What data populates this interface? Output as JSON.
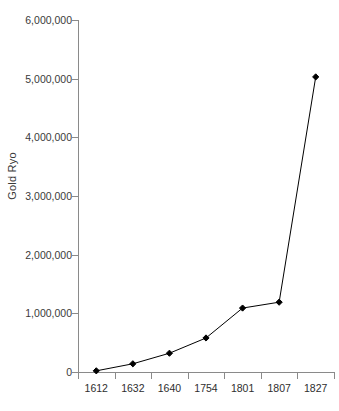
{
  "chart_data": {
    "type": "line",
    "title": "",
    "xlabel": "",
    "ylabel": "Gold Ryo",
    "categories": [
      "1612",
      "1632",
      "1640",
      "1754",
      "1801",
      "1807",
      "1827"
    ],
    "values": [
      20000,
      140000,
      320000,
      580000,
      1090000,
      1190000,
      5030000
    ],
    "series": [
      {
        "name": "Gold Ryo",
        "values": [
          20000,
          140000,
          320000,
          580000,
          1090000,
          1190000,
          5030000
        ]
      }
    ],
    "ylim": [
      0,
      6000000
    ],
    "ytick_values": [
      0,
      1000000,
      2000000,
      3000000,
      4000000,
      5000000,
      6000000
    ],
    "ytick_labels": [
      "0",
      "1,000,000",
      "2,000,000",
      "3,000,000",
      "4,000,000",
      "5,000,000",
      "6,000,000"
    ],
    "grid": false,
    "legend": "none",
    "marker": "diamond",
    "line_color": "#000000",
    "marker_color": "#000000",
    "axis_color": "#8a8a8a",
    "background_color": "#ffffff"
  }
}
